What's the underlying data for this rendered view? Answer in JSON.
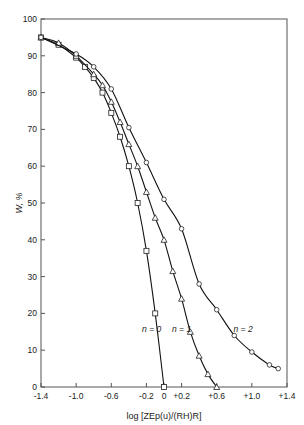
{
  "chart_data": {
    "type": "line",
    "title": "",
    "xlabel": "log [ZEp(u)/(RH)R]",
    "ylabel": "W, %",
    "xlim": [
      -1.4,
      1.4
    ],
    "ylim": [
      0,
      100
    ],
    "xticks": [
      -1.4,
      -1.0,
      -0.6,
      -0.2,
      0,
      0.2,
      0.6,
      1.0,
      1.4
    ],
    "xtick_labels": [
      "-1.4",
      "-1.0",
      "-0.6",
      "-0.2",
      "0",
      "+0.2",
      "+0.6",
      "+1.0",
      "+1.4"
    ],
    "yticks": [
      0,
      10,
      20,
      30,
      40,
      50,
      60,
      70,
      80,
      90,
      100
    ],
    "ytick_labels": [
      "0",
      "10",
      "20",
      "30",
      "40",
      "50",
      "60",
      "70",
      "80",
      "90",
      "100"
    ],
    "grid": false,
    "legend": "inline annotations",
    "series": [
      {
        "name": "n = 0",
        "marker": "square",
        "label_pos": [
          -0.14,
          15
        ],
        "x": [
          -1.4,
          -1.2,
          -1.0,
          -0.9,
          -0.8,
          -0.7,
          -0.6,
          -0.5,
          -0.4,
          -0.3,
          -0.2,
          -0.1,
          0.0
        ],
        "y": [
          95,
          93,
          89.5,
          87,
          84,
          80,
          74.5,
          68,
          60,
          50,
          37,
          20,
          0
        ]
      },
      {
        "name": "n = 1",
        "marker": "triangle",
        "label_pos": [
          0.2,
          15
        ],
        "x": [
          -1.4,
          -1.2,
          -1.0,
          -0.8,
          -0.7,
          -0.6,
          -0.5,
          -0.4,
          -0.3,
          -0.2,
          -0.1,
          0.0,
          0.1,
          0.2,
          0.3,
          0.4,
          0.5,
          0.6
        ],
        "y": [
          95,
          93.5,
          90,
          85,
          82,
          77.5,
          72,
          66,
          60,
          53,
          46,
          40,
          31.5,
          24,
          15,
          8.5,
          3.5,
          0
        ]
      },
      {
        "name": "n = 2",
        "marker": "circle",
        "label_pos": [
          0.9,
          15
        ],
        "x": [
          -1.4,
          -1.0,
          -0.8,
          -0.6,
          -0.4,
          -0.2,
          0.0,
          0.2,
          0.4,
          0.6,
          0.8,
          1.0,
          1.2,
          1.3
        ],
        "y": [
          95,
          90.5,
          87,
          81,
          70.5,
          61,
          51,
          43,
          28,
          21,
          14,
          9.5,
          6,
          5
        ]
      }
    ]
  }
}
